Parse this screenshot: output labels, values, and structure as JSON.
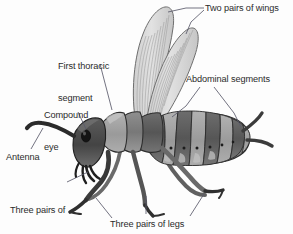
{
  "diagram": {
    "background_color": "#fdfdfd",
    "text_color": "#2b2b2b",
    "leader_line_color": "#5a5a6a",
    "palette": {
      "wing_fill": "#d9d9d9",
      "wing_vein": "#9a9a9a",
      "wing_outline": "#6e6e6e",
      "head_dark": "#4a4a4a",
      "eye_black": "#161616",
      "thorax_mid": "#7d7d7d",
      "thorax_light": "#a8a8a8",
      "abdomen_dark": "#5e5e5e",
      "abdomen_light": "#9e9e9e",
      "leg_dark": "#3c3c3c",
      "leg_light": "#8a8a8a",
      "outline": "#2e2e2e"
    },
    "labels": [
      {
        "id": "two-pairs-of-wings",
        "text": "Two pairs of wings",
        "lines": [
          "Two pairs of wings"
        ],
        "x": 205,
        "y": 4,
        "align": "left"
      },
      {
        "id": "first-thoracic-segment",
        "text": "First thoracic segment",
        "lines": [
          "First thoracic",
          "segment"
        ],
        "x": 58,
        "y": 41,
        "align": "left"
      },
      {
        "id": "abdominal-segments",
        "text": "Abdominal segments",
        "lines": [
          "Abdominal segments"
        ],
        "x": 186,
        "y": 75,
        "align": "left"
      },
      {
        "id": "compound-eye",
        "text": "Compound eye",
        "lines": [
          "Compound",
          "eye"
        ],
        "x": 44,
        "y": 90,
        "align": "left"
      },
      {
        "id": "antenna",
        "text": "Antenna",
        "lines": [
          "Antenna"
        ],
        "x": 6,
        "y": 153,
        "align": "left"
      },
      {
        "id": "three-pairs-of-mouthparts",
        "text": "Three pairs of mouthparts",
        "lines": [
          "Three pairs of",
          "mouthparts"
        ],
        "x": 10,
        "y": 185,
        "align": "left"
      },
      {
        "id": "three-pairs-of-legs",
        "text": "Three pairs of legs",
        "lines": [
          "Three pairs of legs"
        ],
        "x": 110,
        "y": 220,
        "align": "left"
      }
    ],
    "parts": [
      {
        "id": "wing-upper",
        "name": "upper wing"
      },
      {
        "id": "wing-lower",
        "name": "lower wing"
      },
      {
        "id": "head",
        "name": "head"
      },
      {
        "id": "compound-eye",
        "name": "compound eye"
      },
      {
        "id": "antenna",
        "name": "antenna"
      },
      {
        "id": "mouthparts",
        "name": "mouthparts"
      },
      {
        "id": "prothorax",
        "name": "first thoracic segment"
      },
      {
        "id": "mesothorax",
        "name": "second thoracic segment"
      },
      {
        "id": "metathorax",
        "name": "third thoracic segment"
      },
      {
        "id": "abdomen",
        "name": "abdomen (segmented)"
      },
      {
        "id": "legs",
        "name": "three pairs of legs"
      },
      {
        "id": "cerci",
        "name": "cerci"
      }
    ],
    "counts": {
      "wing_pairs": 2,
      "leg_pairs": 3,
      "mouthpart_pairs": 3,
      "abdominal_segments": 9
    }
  }
}
